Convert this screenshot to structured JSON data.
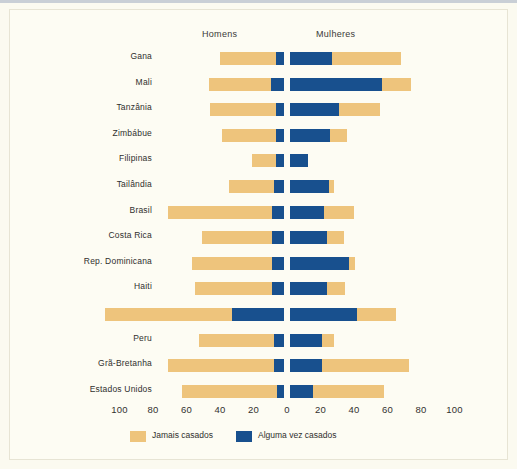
{
  "chart_data": {
    "type": "bar",
    "orientation": "horizontal",
    "subtype": "diverging-population-pyramid",
    "title": "",
    "xlabel": "",
    "ylabel": "",
    "xlim": [
      -100,
      100
    ],
    "grid": false,
    "legend_position": "bottom-left",
    "axis_ticks": [
      "100",
      "80",
      "60",
      "40",
      "20",
      "0",
      "20",
      "40",
      "60",
      "80",
      "100"
    ],
    "axis_tick_values": [
      -100,
      -80,
      -60,
      -40,
      -20,
      0,
      20,
      40,
      60,
      80,
      100
    ],
    "panel_labels": {
      "left": "Homens",
      "right": "Mulheres"
    },
    "legend": [
      {
        "label": "Jamais casados",
        "color": "#eec47c"
      },
      {
        "label": "Alguma vez casados",
        "color": "#18508e"
      }
    ],
    "categories": [
      "Gana",
      "Mali",
      "Tanzânia",
      "Zimbábue",
      "Filipinas",
      "Tailândia",
      "Brasil",
      "Costa Rica",
      "Rep. Dominicana",
      "Haiti",
      "Jamaica",
      "Peru",
      "Grã-Bretanha",
      "Estados Unidos"
    ],
    "series": [
      {
        "name": "Homens - Jamais casados",
        "side": "left",
        "color": "#eec47c",
        "values": [
          33,
          37,
          39,
          32,
          14,
          27,
          62,
          42,
          48,
          46,
          76,
          45,
          63,
          57
        ]
      },
      {
        "name": "Homens - Alguma vez casados",
        "side": "left",
        "color": "#18508e",
        "values": [
          5,
          8,
          5,
          5,
          5,
          6,
          7,
          7,
          7,
          7,
          31,
          6,
          6,
          4
        ]
      },
      {
        "name": "Mulheres - Alguma vez casados",
        "side": "right",
        "color": "#18508e",
        "values": [
          25,
          55,
          29,
          24,
          11,
          23,
          20,
          22,
          35,
          22,
          40,
          19,
          19,
          14
        ]
      },
      {
        "name": "Mulheres - Jamais casados",
        "side": "right",
        "color": "#eec47c",
        "values": [
          41,
          17,
          25,
          10,
          0,
          3,
          18,
          10,
          4,
          11,
          23,
          7,
          52,
          42
        ]
      }
    ]
  },
  "header": {
    "homens": "Homens",
    "mulheres": "Mulheres"
  },
  "rows": [
    {
      "label": "Gana",
      "left_tan": 33,
      "left_blue": 5,
      "right_blue": 25,
      "right_tan": 41
    },
    {
      "label": "Mali",
      "left_tan": 37,
      "left_blue": 8,
      "right_blue": 55,
      "right_tan": 17
    },
    {
      "label": "Tanzânia",
      "left_tan": 39,
      "left_blue": 5,
      "right_blue": 29,
      "right_tan": 25
    },
    {
      "label": "Zimbábue",
      "left_tan": 32,
      "left_blue": 5,
      "right_blue": 24,
      "right_tan": 10
    },
    {
      "label": "Filipinas",
      "left_tan": 14,
      "left_blue": 5,
      "right_blue": 11,
      "right_tan": 0
    },
    {
      "label": "Tailândia",
      "left_tan": 27,
      "left_blue": 6,
      "right_blue": 23,
      "right_tan": 3
    },
    {
      "label": "Brasil",
      "left_tan": 62,
      "left_blue": 7,
      "right_blue": 20,
      "right_tan": 18
    },
    {
      "label": "Costa Rica",
      "left_tan": 42,
      "left_blue": 7,
      "right_blue": 22,
      "right_tan": 10
    },
    {
      "label": "Rep. Dominicana",
      "left_tan": 48,
      "left_blue": 7,
      "right_blue": 35,
      "right_tan": 4
    },
    {
      "label": "Haiti",
      "left_tan": 46,
      "left_blue": 7,
      "right_blue": 22,
      "right_tan": 11
    },
    {
      "label": "Jamaica",
      "left_tan": 76,
      "left_blue": 31,
      "right_blue": 40,
      "right_tan": 23
    },
    {
      "label": "Peru",
      "left_tan": 45,
      "left_blue": 6,
      "right_blue": 19,
      "right_tan": 7
    },
    {
      "label": "Grã-Bretanha",
      "left_tan": 63,
      "left_blue": 6,
      "right_blue": 19,
      "right_tan": 52
    },
    {
      "label": "Estados Unidos",
      "left_tan": 57,
      "left_blue": 4,
      "right_blue": 14,
      "right_tan": 42
    }
  ],
  "legend": {
    "item1": "Jamais casados",
    "item2": "Alguma vez casados"
  },
  "colors": {
    "tan": "#eec47c",
    "blue": "#18508e",
    "background": "#fdfcf3"
  }
}
